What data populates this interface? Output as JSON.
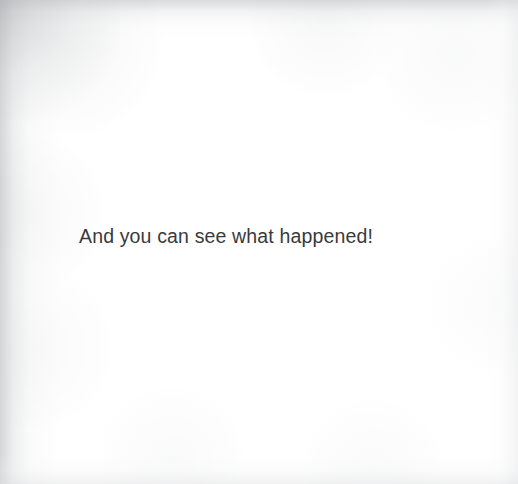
{
  "page": {
    "kind": "scanned-book-page",
    "width": 518,
    "height": 484,
    "background_color": "#ffffff",
    "ink_color": "#3a3a3c",
    "edge_shadow_color": "#b2b4b6"
  },
  "body": {
    "line": "And you can see what happened!"
  }
}
